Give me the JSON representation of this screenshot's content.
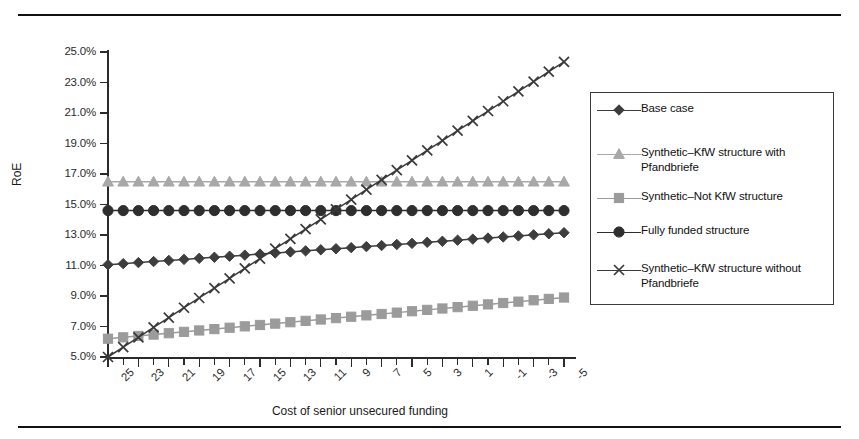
{
  "figure": {
    "width": 859,
    "height": 439,
    "background": "#ffffff",
    "rule_color": "#111111"
  },
  "chart_data": {
    "type": "line",
    "title": "",
    "xlabel": "Cost of senior unsecured funding",
    "ylabel": "RoE",
    "xlim": [
      25,
      -5
    ],
    "ylim": [
      0.05,
      0.25
    ],
    "y_tick_labels": [
      "25.0%",
      "23.0%",
      "21.0%",
      "19.0%",
      "17.0%",
      "15.0%",
      "13.0%",
      "11.0%",
      "9.0%",
      "7.0%",
      "5.0%"
    ],
    "y_tick_values": [
      25.0,
      23.0,
      21.0,
      19.0,
      17.0,
      15.0,
      13.0,
      11.0,
      9.0,
      7.0,
      5.0
    ],
    "x_tick_labels": [
      "25",
      "23",
      "21",
      "19",
      "17",
      "15",
      "13",
      "11",
      "9",
      "7",
      "5",
      "3",
      "1",
      "-1",
      "-3",
      "-5"
    ],
    "x_tick_values": [
      25,
      23,
      21,
      19,
      17,
      15,
      13,
      11,
      9,
      7,
      5,
      3,
      1,
      -1,
      -3,
      -5
    ],
    "x_minor_count": 31,
    "x": [
      25,
      24,
      23,
      22,
      21,
      20,
      19,
      18,
      17,
      16,
      15,
      14,
      13,
      12,
      11,
      10,
      9,
      8,
      7,
      6,
      5,
      4,
      3,
      2,
      1,
      0,
      -1,
      -2,
      -3,
      -4,
      -5
    ],
    "grid": false,
    "legend_position": "right-outside",
    "series": [
      {
        "name": "Base case",
        "marker": "diamond",
        "color": "#3d3d3d",
        "values": [
          11.05,
          11.12,
          11.19,
          11.26,
          11.33,
          11.4,
          11.47,
          11.54,
          11.61,
          11.68,
          11.75,
          11.82,
          11.89,
          11.96,
          12.03,
          12.1,
          12.17,
          12.24,
          12.31,
          12.38,
          12.45,
          12.52,
          12.59,
          12.66,
          12.73,
          12.8,
          12.87,
          12.94,
          13.01,
          13.08,
          13.15
        ]
      },
      {
        "name": "Synthetic-KfW structure with Pfandbriefe",
        "marker": "triangle",
        "color": "#a8a8a8",
        "values": [
          16.5,
          16.5,
          16.5,
          16.5,
          16.5,
          16.5,
          16.5,
          16.5,
          16.5,
          16.5,
          16.5,
          16.5,
          16.5,
          16.5,
          16.5,
          16.5,
          16.5,
          16.5,
          16.5,
          16.5,
          16.5,
          16.5,
          16.5,
          16.5,
          16.5,
          16.5,
          16.5,
          16.5,
          16.5,
          16.5,
          16.5
        ]
      },
      {
        "name": "Synthetic-Not KfW structure",
        "marker": "square",
        "color": "#9b9b9b",
        "values": [
          6.2,
          6.29,
          6.38,
          6.47,
          6.56,
          6.65,
          6.74,
          6.83,
          6.92,
          7.01,
          7.1,
          7.19,
          7.28,
          7.37,
          7.46,
          7.55,
          7.64,
          7.73,
          7.82,
          7.91,
          8.0,
          8.09,
          8.18,
          8.27,
          8.36,
          8.45,
          8.54,
          8.63,
          8.72,
          8.81,
          8.9
        ]
      },
      {
        "name": "Fully funded structure",
        "marker": "circle",
        "color": "#2e2e2e",
        "values": [
          14.6,
          14.6,
          14.6,
          14.6,
          14.6,
          14.6,
          14.6,
          14.6,
          14.6,
          14.6,
          14.6,
          14.6,
          14.6,
          14.6,
          14.6,
          14.6,
          14.6,
          14.6,
          14.6,
          14.6,
          14.6,
          14.6,
          14.6,
          14.6,
          14.6,
          14.6,
          14.6,
          14.6,
          14.6,
          14.6,
          14.6
        ]
      },
      {
        "name": "Synthetic-KfW structure without Pfandbriefe",
        "marker": "x",
        "color": "#3a3a3a",
        "values": [
          5.0,
          5.65,
          6.29,
          6.94,
          7.58,
          8.23,
          8.87,
          9.52,
          10.16,
          10.81,
          11.45,
          12.1,
          12.74,
          13.39,
          14.03,
          14.68,
          15.32,
          15.97,
          16.61,
          17.26,
          17.9,
          18.55,
          19.19,
          19.84,
          20.48,
          21.13,
          21.77,
          22.42,
          23.06,
          23.71,
          24.35
        ]
      }
    ]
  },
  "legend": {
    "border_color": "#3a3a3a",
    "entries": [
      {
        "label": "Base case",
        "marker": "diamond",
        "color": "#3d3d3d"
      },
      {
        "label": "Synthetic–KfW structure with Pfandbriefe",
        "marker": "triangle",
        "color": "#a8a8a8"
      },
      {
        "label": "Synthetic–Not KfW structure",
        "marker": "square",
        "color": "#9b9b9b"
      },
      {
        "label": "Fully funded structure",
        "marker": "circle",
        "color": "#2e2e2e"
      },
      {
        "label": "Synthetic–KfW structure without Pfandbriefe",
        "marker": "x",
        "color": "#3a3a3a"
      }
    ]
  }
}
